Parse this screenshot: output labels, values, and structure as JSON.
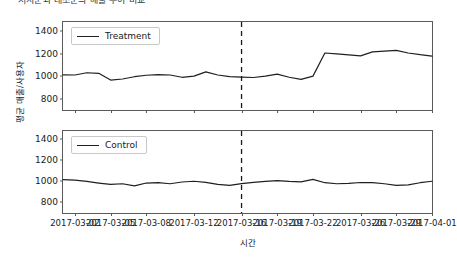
{
  "figure": {
    "suptitle": "처치군과 대조군의 매출 추이 비교",
    "xlabel": "시간",
    "ylabel": "평균 매출/사용자"
  },
  "chart_data": {
    "type": "line",
    "title": "처치군과 대조군의 매출 추이 비교",
    "xlabel": "시간",
    "ylabel": "평균 매출/사용자",
    "grid": false,
    "legend_position": "upper left",
    "ylim": [
      700,
      1480
    ],
    "yticks": [
      800,
      1000,
      1200,
      1400
    ],
    "xlim": [
      "2017-03-01",
      "2017-04-01"
    ],
    "xticks": [
      "2017-03-02",
      "2017-03-05",
      "2017-03-08",
      "2017-03-12",
      "2017-03-16",
      "2017-03-19",
      "2017-03-22",
      "2017-03-26",
      "2017-03-29",
      "2017-04-01"
    ],
    "annotations": [
      {
        "type": "vline",
        "label": "intervention",
        "x": "2017-03-16",
        "style": "dashed",
        "color": "#1a1a1a"
      }
    ],
    "subplots": [
      {
        "index": 0,
        "legend": "Treatment",
        "x": [
          "2017-03-01",
          "2017-03-02",
          "2017-03-03",
          "2017-03-04",
          "2017-03-05",
          "2017-03-06",
          "2017-03-07",
          "2017-03-08",
          "2017-03-09",
          "2017-03-10",
          "2017-03-11",
          "2017-03-12",
          "2017-03-13",
          "2017-03-14",
          "2017-03-15",
          "2017-03-16",
          "2017-03-17",
          "2017-03-18",
          "2017-03-19",
          "2017-03-20",
          "2017-03-21",
          "2017-03-22",
          "2017-03-23",
          "2017-03-24",
          "2017-03-25",
          "2017-03-26",
          "2017-03-27",
          "2017-03-28",
          "2017-03-29",
          "2017-03-30",
          "2017-03-31",
          "2017-04-01"
        ],
        "values": [
          1012,
          1010,
          1030,
          1025,
          965,
          975,
          995,
          1008,
          1014,
          1010,
          990,
          1000,
          1038,
          1010,
          995,
          992,
          988,
          1000,
          1018,
          990,
          972,
          1000,
          1205,
          1198,
          1188,
          1180,
          1215,
          1222,
          1228,
          1205,
          1190,
          1178
        ]
      },
      {
        "index": 1,
        "legend": "Control",
        "x": [
          "2017-03-01",
          "2017-03-02",
          "2017-03-03",
          "2017-03-04",
          "2017-03-05",
          "2017-03-06",
          "2017-03-07",
          "2017-03-08",
          "2017-03-09",
          "2017-03-10",
          "2017-03-11",
          "2017-03-12",
          "2017-03-13",
          "2017-03-14",
          "2017-03-15",
          "2017-03-16",
          "2017-03-17",
          "2017-03-18",
          "2017-03-19",
          "2017-03-20",
          "2017-03-21",
          "2017-03-22",
          "2017-03-23",
          "2017-03-24",
          "2017-03-25",
          "2017-03-26",
          "2017-03-27",
          "2017-03-28",
          "2017-03-29",
          "2017-03-30",
          "2017-03-31",
          "2017-04-01"
        ],
        "values": [
          1018,
          1012,
          1000,
          985,
          972,
          978,
          958,
          985,
          988,
          978,
          995,
          1002,
          992,
          972,
          962,
          980,
          992,
          1000,
          1008,
          1000,
          996,
          1020,
          988,
          978,
          982,
          990,
          988,
          978,
          962,
          968,
          988,
          1002
        ]
      }
    ]
  }
}
